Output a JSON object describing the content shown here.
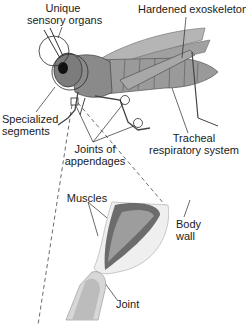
{
  "labels": {
    "sensory": [
      "Unique",
      "sensory organs"
    ],
    "exoskeleton": "Hardened exoskeleton",
    "segments": [
      "Specialized",
      "segments"
    ],
    "tracheal": [
      "Tracheal",
      "respiratory system"
    ],
    "joints": [
      "Joints of",
      "appendages"
    ],
    "muscles": "Muscles",
    "body_wall": [
      "Body",
      "wall"
    ],
    "joint": "Joint"
  },
  "colors": {
    "line": "#2a2a2a",
    "body_dark": "#5a5a5a",
    "body_mid": "#8c8c8c",
    "body_light": "#c8c8c8",
    "leg_tube": "#e6e6e6"
  }
}
